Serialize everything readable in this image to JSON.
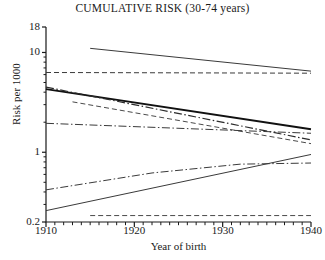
{
  "chart_data": {
    "type": "line",
    "title": "CUMULATIVE RISK (30-74 years)",
    "xlabel": "Year of birth",
    "ylabel": "Risk per 1000",
    "xlim": [
      1910,
      1940
    ],
    "ylim": [
      0.2,
      18
    ],
    "yscale": "log",
    "grid": false,
    "legend": "none",
    "xticks": [
      1910,
      1920,
      1930,
      1940
    ],
    "xtick_labels": [
      "1910",
      "1920",
      "1930",
      "1940"
    ],
    "yticks": [
      0.2,
      1,
      10,
      18
    ],
    "ytick_labels": [
      "0.2",
      "1",
      "10",
      "18"
    ],
    "series": [
      {
        "name": "series-1-solid-declining-top",
        "style": "solid",
        "width": 1.0,
        "color": "#3a3a3a",
        "x": [
          1915,
          1940
        ],
        "values": [
          11.0,
          6.5
        ]
      },
      {
        "name": "series-2-dashed-flat-upper",
        "style": "dashed",
        "width": 1.0,
        "color": "#3a3a3a",
        "x": [
          1910,
          1940
        ],
        "values": [
          6.3,
          6.2
        ]
      },
      {
        "name": "series-3-solid-thick-steep-decline",
        "style": "solid",
        "width": 1.8,
        "color": "#111111",
        "x": [
          1910,
          1940
        ],
        "values": [
          4.3,
          1.7
        ]
      },
      {
        "name": "series-4-dashdot-steep-decline",
        "style": "dashdot",
        "width": 1.2,
        "color": "#2b2b2b",
        "x": [
          1910,
          1940
        ],
        "values": [
          4.5,
          1.33
        ]
      },
      {
        "name": "series-5-dashed-medium-decline",
        "style": "dashed",
        "width": 1.0,
        "color": "#4a4a4a",
        "x": [
          1913,
          1940
        ],
        "values": [
          3.2,
          1.22
        ]
      },
      {
        "name": "series-6-dashdot-slight-decline",
        "style": "dashdot",
        "width": 1.0,
        "color": "#3a3a3a",
        "x": [
          1910,
          1940
        ],
        "values": [
          1.95,
          1.55
        ]
      },
      {
        "name": "series-7-dashdot-rising",
        "style": "dashdot",
        "width": 1.0,
        "color": "#3a3a3a",
        "x": [
          1910,
          1922,
          1932,
          1940
        ],
        "values": [
          0.42,
          0.62,
          0.76,
          0.78
        ]
      },
      {
        "name": "series-8-solid-rising",
        "style": "solid",
        "width": 1.0,
        "color": "#3a3a3a",
        "x": [
          1910,
          1940
        ],
        "values": [
          0.26,
          0.95
        ]
      },
      {
        "name": "series-9-dashed-flat-bottom",
        "style": "dashed",
        "width": 1.0,
        "color": "#4a4a4a",
        "x": [
          1915,
          1940
        ],
        "values": [
          0.232,
          0.232
        ]
      }
    ]
  },
  "axes": {
    "frame_color": "#1a1a1a"
  }
}
